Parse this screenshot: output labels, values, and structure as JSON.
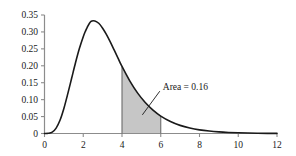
{
  "chart_data": {
    "type": "area",
    "title": "",
    "subtitle": "",
    "xlabel": "",
    "ylabel": "",
    "xlim": [
      0,
      12
    ],
    "ylim": [
      0,
      0.35
    ],
    "grid": false,
    "legend": null,
    "x_ticks": [
      "0",
      "2",
      "4",
      "6",
      "8",
      "10",
      "12"
    ],
    "x_tick_values": [
      0,
      2,
      4,
      6,
      8,
      10,
      12
    ],
    "y_ticks": [
      "0",
      "0.05",
      "0.10",
      "0.15",
      "0.20",
      "0.25",
      "0.30",
      "0.35"
    ],
    "y_tick_values": [
      0,
      0.05,
      0.1,
      0.15,
      0.2,
      0.25,
      0.3,
      0.35
    ],
    "curve_color": "#1a1a1a",
    "shade_color": "#c6c6c6",
    "axis_color": "#8c8c8c",
    "series": [
      {
        "name": "density",
        "x": [
          0,
          0.2,
          0.4,
          0.6,
          0.8,
          1.0,
          1.2,
          1.4,
          1.6,
          1.8,
          2.0,
          2.1,
          2.2,
          2.4,
          2.6,
          2.8,
          3.0,
          3.2,
          3.4,
          3.6,
          3.8,
          4.0,
          4.4,
          4.8,
          5.2,
          5.6,
          6.0,
          6.5,
          7.0,
          7.5,
          8.0,
          8.5,
          9.0,
          9.5,
          10.0,
          10.5,
          11.0,
          11.5,
          12.0
        ],
        "values": [
          0.0,
          0.0005,
          0.004,
          0.016,
          0.039,
          0.074,
          0.117,
          0.163,
          0.209,
          0.251,
          0.286,
          0.3005,
          0.313,
          0.331,
          0.3325,
          0.3255,
          0.311,
          0.292,
          0.27,
          0.246,
          0.222,
          0.198,
          0.1555,
          0.12,
          0.0915,
          0.069,
          0.0515,
          0.0355,
          0.024,
          0.0162,
          0.0108,
          0.0072,
          0.0047,
          0.0031,
          0.002,
          0.0013,
          0.0008,
          0.0005,
          0.0003
        ]
      }
    ],
    "shaded_region": {
      "x_start": 4,
      "x_end": 6,
      "label": "Area = 0.16",
      "area_value": 0.16
    },
    "annotations": [
      {
        "text": "Area = 0.16",
        "type": "callout",
        "leader_from_x": 5.05,
        "leader_from_y": 0.055,
        "leader_to_x": 5.95,
        "leader_to_y": 0.125
      }
    ]
  }
}
